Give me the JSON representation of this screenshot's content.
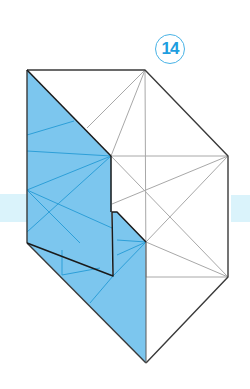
{
  "figure": {
    "type": "origami-step-diagram",
    "step_number": "14",
    "colors": {
      "paper_colored_side": "#7cc6ee",
      "colored_crease": "#2d9fd8",
      "white_crease": "#a8a8a8",
      "outline": "#3a3a3a",
      "edge_dark": "#1a1a1a",
      "background_band": "#daf3fb",
      "step_badge": "#1e9ee0"
    },
    "regions": [
      {
        "name": "left-colored-panel",
        "color": "paper_colored_side"
      },
      {
        "name": "lower-colored-flap",
        "color": "paper_colored_side"
      },
      {
        "name": "right-white-panel",
        "color": "white"
      },
      {
        "name": "top-white-triangle",
        "color": "white"
      }
    ]
  }
}
